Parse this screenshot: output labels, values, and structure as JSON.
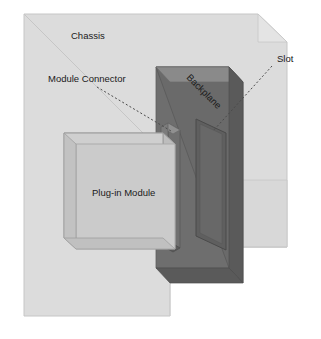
{
  "diagram": {
    "type": "isometric-technical-illustration",
    "background_color": "#ffffff",
    "labels": {
      "chassis": "Chassis",
      "module_connector": "Module Connector",
      "slot": "Slot",
      "backplane": "Backplane",
      "plug_in_module": "Plug-in Module"
    },
    "colors": {
      "chassis_fill": "#dcdcdc",
      "chassis_side_fill": "#d2d2d2",
      "chassis_stroke": "#c2c2c2",
      "backplane_face": "#6e6e6e",
      "backplane_edge": "#5a5a5a",
      "backplane_top": "#8a8a8a",
      "slot_fill": "#5f5f5f",
      "slot_stroke": "#4e4e4e",
      "connector_face": "#707070",
      "connector_edge": "#585858",
      "connector_top": "#909090",
      "module_face": "#cfcfcf",
      "module_top": "#c4c4c4",
      "module_side": "#bcbcbc",
      "module_stroke": "#9a9a9a",
      "leader_line": "#4a4a4a",
      "text": "#1a1a1a"
    },
    "parts": [
      {
        "name": "chassis",
        "label": "Chassis",
        "description": "Outer enclosure drawn as a light gray isometric volume with a chamfered top-right corner"
      },
      {
        "name": "backplane",
        "label": "Backplane",
        "description": "Dark vertical panel at the rear of the chassis carrying the slot"
      },
      {
        "name": "slot",
        "label": "Slot",
        "description": "Recessed rectangular opening on the backplane face"
      },
      {
        "name": "module-connector",
        "label": "Module Connector",
        "description": "Thin dark slab on the rear of the plug-in module that mates with the slot"
      },
      {
        "name": "plug-in-module",
        "label": "Plug-in Module",
        "description": "Light gray rectangular module box inserted into the chassis"
      }
    ],
    "leader_lines": [
      {
        "name": "module-connector-leader",
        "from_label": "Module Connector",
        "to_part": "module-connector",
        "style": "dashed"
      },
      {
        "name": "slot-leader",
        "from_label": "Slot",
        "to_part": "slot",
        "style": "dashed"
      }
    ]
  }
}
